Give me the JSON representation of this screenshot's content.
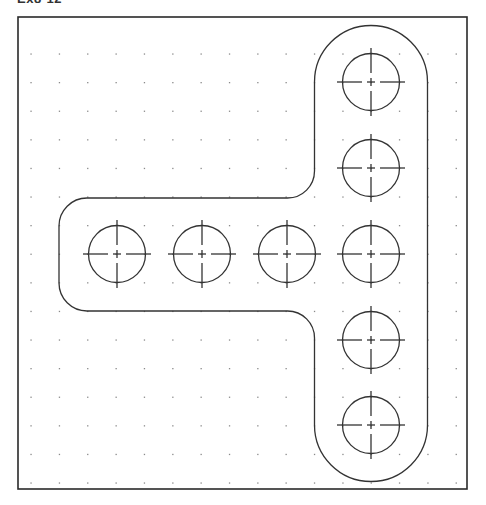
{
  "title": "Ex8-12",
  "colors": {
    "background": "#ffffff",
    "frame": "#2a2a2a",
    "outline": "#333333",
    "grid_dot": "#8a8a8a",
    "centerline": "#333333"
  },
  "frame": {
    "x": 18,
    "y": 17,
    "width": 449,
    "height": 472
  },
  "grid": {
    "x_start": 31,
    "y_start": 54,
    "spacing_x": 28.35,
    "spacing_y": 28.6,
    "cols": 16,
    "rows": 16
  },
  "part": {
    "shape": "T-bracket outline with filleted corners",
    "vertical_bar": {
      "center_x": 371,
      "top_center_y": 82,
      "bottom_center_y": 425,
      "half_width": 56.5
    },
    "horizontal_bar": {
      "left_x": 59,
      "top_y": 198,
      "bottom_y": 311,
      "corner_radius": 28,
      "fillet_radius": 27
    }
  },
  "holes": {
    "radius": 28.5,
    "centerline_extent": 34,
    "items": [
      {
        "cx": 371,
        "cy": 82
      },
      {
        "cx": 371,
        "cy": 168
      },
      {
        "cx": 371,
        "cy": 254
      },
      {
        "cx": 371,
        "cy": 340
      },
      {
        "cx": 371,
        "cy": 425
      },
      {
        "cx": 117,
        "cy": 254
      },
      {
        "cx": 202,
        "cy": 254
      },
      {
        "cx": 287,
        "cy": 254
      }
    ]
  }
}
